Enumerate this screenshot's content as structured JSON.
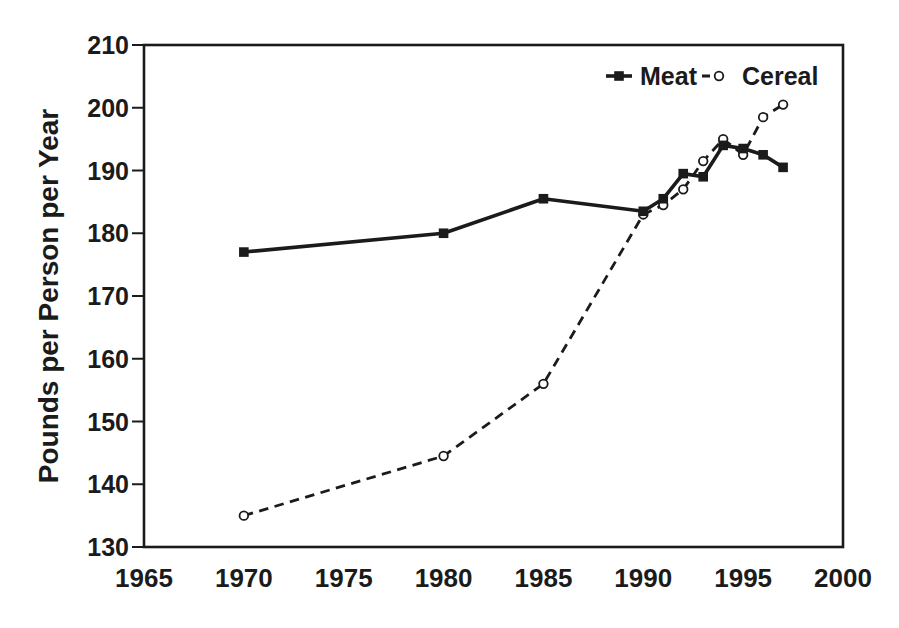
{
  "chart_data": {
    "type": "line",
    "title": "",
    "xlabel": "",
    "ylabel": "Pounds per Person per Year",
    "xlim": [
      1965,
      2000
    ],
    "ylim": [
      130,
      210
    ],
    "x_ticks": [
      1965,
      1970,
      1975,
      1980,
      1985,
      1990,
      1995,
      2000
    ],
    "y_ticks": [
      130,
      140,
      150,
      160,
      170,
      180,
      190,
      200,
      210
    ],
    "grid": false,
    "legend_position": "top-right-inside",
    "ink_color": "#1b1b1b",
    "background_color": "#ffffff",
    "x": [
      1970,
      1980,
      1985,
      1990,
      1991,
      1992,
      1993,
      1994,
      1995,
      1996,
      1997
    ],
    "series": [
      {
        "name": "Meat",
        "line": "solid",
        "marker": "filled-square",
        "values": [
          177,
          180,
          185.5,
          183.5,
          185.5,
          189.5,
          189,
          194,
          193.5,
          192.5,
          190.5
        ]
      },
      {
        "name": "Cereal",
        "line": "dashed",
        "marker": "open-circle",
        "values": [
          135,
          144.5,
          156,
          183,
          184.5,
          187,
          191.5,
          195,
          192.5,
          198.5,
          200.5
        ]
      }
    ]
  }
}
